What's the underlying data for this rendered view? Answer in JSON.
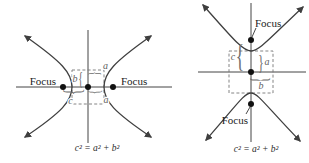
{
  "figure": {
    "left": {
      "focus_left": "Focus",
      "focus_right": "Focus",
      "b_label": "b",
      "a_top_label": "a",
      "c_bottom_label": "c",
      "a_bottom_label": "a",
      "formula": "c² = a² + b²"
    },
    "right": {
      "focus_top": "Focus",
      "focus_bottom": "Focus",
      "c_label": "c",
      "a_label": "a",
      "b_label": "b",
      "formula": "c² = a² + b²"
    }
  },
  "glyphs": {
    "brace_open": "{",
    "brace_close": "}"
  },
  "colors": {
    "curve": "#3f3f3f",
    "axis": "#444444",
    "box_dash": "#777777",
    "focus_text": "#1c1c1c",
    "measure_text": "#5f5f5f"
  }
}
